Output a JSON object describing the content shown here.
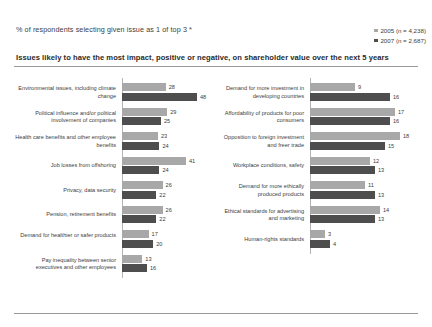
{
  "header": {
    "title": "% of respondents selecting given issue as 1 of top 3 *",
    "subtitle": "Issues likely to have the most impact, positive or negative, on shareholder value over the next 5 years"
  },
  "legend": {
    "items": [
      {
        "label": "2005 (n = 4,238)",
        "color": "#a8a8a8"
      },
      {
        "label": "2007 (n = 2,687)",
        "color": "#4e4e4e"
      }
    ]
  },
  "colors": {
    "series_2005": "#a8a8a8",
    "series_2007": "#4e4e4e",
    "axis": "#b4b4b4",
    "rule": "#9a9a9a",
    "text": "#3d3d3d"
  },
  "chart_data": {
    "type": "bar",
    "title": "% of respondents selecting given issue as 1 of top 3 *",
    "subtitle": "Issues likely to have the most impact, positive or negative, on shareholder value over the next 5 years",
    "orientation": "horizontal",
    "grid": false,
    "legend_position": "top-right",
    "xlabel": "",
    "ylabel": "",
    "series": [
      {
        "name": "2005 (n = 4,238)",
        "color": "#a8a8a8"
      },
      {
        "name": "2007 (n = 2,687)",
        "color": "#4e4e4e"
      }
    ],
    "panels": [
      {
        "name": "left",
        "xlim": [
          0,
          50
        ],
        "categories": [
          {
            "label": "Environmental issues, including climate change",
            "values": [
              28,
              48
            ]
          },
          {
            "label": "Political influence and/or political involvement of companies",
            "values": [
              29,
              25
            ]
          },
          {
            "label": "Health care benefits and other employee benefits",
            "values": [
              23,
              24
            ]
          },
          {
            "label": "Job losses from offshoring",
            "values": [
              41,
              24
            ]
          },
          {
            "label": "Privacy, data security",
            "values": [
              26,
              22
            ]
          },
          {
            "label": "Pension, retirement benefits",
            "values": [
              26,
              22
            ]
          },
          {
            "label": "Demand for healthier or safer products",
            "values": [
              17,
              20
            ]
          },
          {
            "label": "Pay inequality between senior executives and other employees",
            "values": [
              13,
              16
            ]
          }
        ]
      },
      {
        "name": "right",
        "xlim": [
          0,
          20
        ],
        "categories": [
          {
            "label": "Demand for more investment in developing countries",
            "values": [
              9,
              16
            ]
          },
          {
            "label": "Affordability of products for poor consumers",
            "values": [
              17,
              16
            ]
          },
          {
            "label": "Opposition to foreign investment and freer trade",
            "values": [
              18,
              15
            ]
          },
          {
            "label": "Workplace conditions, safety",
            "values": [
              12,
              13
            ]
          },
          {
            "label": "Demand for more ethically produced products",
            "values": [
              11,
              13
            ]
          },
          {
            "label": "Ethical standards for advertising and marketing",
            "values": [
              14,
              13
            ]
          },
          {
            "label": "Human-rights standards",
            "values": [
              3,
              4
            ]
          }
        ]
      }
    ]
  }
}
